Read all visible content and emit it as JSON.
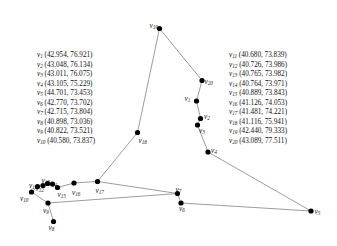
{
  "figure": {
    "type": "node-link-diagram",
    "background_color": "#ffffff",
    "node_color": "#000000",
    "edge_color": "#8a8a8a",
    "text_color": "#111111"
  },
  "coord_list_left": [
    {
      "id": "v",
      "sub": "1",
      "text": "(42.954, 76.921)"
    },
    {
      "id": "v",
      "sub": "2",
      "text": "(43.048, 76.134)"
    },
    {
      "id": "v",
      "sub": "3",
      "text": "(43.011, 76.075)"
    },
    {
      "id": "v",
      "sub": "4",
      "text": "(43.105, 75.229)"
    },
    {
      "id": "v",
      "sub": "5",
      "text": "(44.701, 73.453)"
    },
    {
      "id": "v",
      "sub": "6",
      "text": "(42.770, 73.702)"
    },
    {
      "id": "v",
      "sub": "7",
      "text": "(42.715, 73.804)"
    },
    {
      "id": "v",
      "sub": "8",
      "text": "(40.898, 73.036)"
    },
    {
      "id": "v",
      "sub": "9",
      "text": "(40.822, 73.521)"
    },
    {
      "id": "v",
      "sub": "10",
      "text": "(40.580, 73.837)"
    }
  ],
  "coord_list_right": [
    {
      "id": "v",
      "sub": "11",
      "text": "(40.680, 73.839)"
    },
    {
      "id": "v",
      "sub": "12",
      "text": "(40.726, 73.986)"
    },
    {
      "id": "v",
      "sub": "13",
      "text": "(40.765, 73.982)"
    },
    {
      "id": "v",
      "sub": "14",
      "text": "(40.764, 73.971)"
    },
    {
      "id": "v",
      "sub": "15",
      "text": "(40.889, 73.843)"
    },
    {
      "id": "v",
      "sub": "16",
      "text": "(41.126, 74.053)"
    },
    {
      "id": "v",
      "sub": "17",
      "text": "(41.481, 74.221)"
    },
    {
      "id": "v",
      "sub": "18",
      "text": "(41.116, 75.941)"
    },
    {
      "id": "v",
      "sub": "19",
      "text": "(42.440, 79.333)"
    },
    {
      "id": "v",
      "sub": "20",
      "text": "(43.089, 77.511)"
    }
  ],
  "nodes": [
    {
      "id": "v1",
      "sub": "1",
      "x": 196.5,
      "y": 101.0,
      "label_x": 184.5,
      "label_y": 95.0
    },
    {
      "id": "v2",
      "sub": "2",
      "x": 200.5,
      "y": 118.5,
      "label_x": 204.0,
      "label_y": 112.5
    },
    {
      "id": "v3",
      "sub": "3",
      "x": 197.5,
      "y": 125.0,
      "label_x": 199.0,
      "label_y": 127.0
    },
    {
      "id": "v4",
      "sub": "4",
      "x": 208.0,
      "y": 152.0,
      "label_x": 211.0,
      "label_y": 147.0
    },
    {
      "id": "v5",
      "sub": "5",
      "x": 311.0,
      "y": 211.0,
      "label_x": 314.5,
      "label_y": 207.5
    },
    {
      "id": "v6",
      "sub": "6",
      "x": 181.0,
      "y": 203.0,
      "label_x": 179.0,
      "label_y": 205.0
    },
    {
      "id": "v7",
      "sub": "7",
      "x": 177.5,
      "y": 193.5,
      "label_x": 175.5,
      "label_y": 186.0
    },
    {
      "id": "v8",
      "sub": "8",
      "x": 53.5,
      "y": 221.5,
      "label_x": 48.5,
      "label_y": 224.0
    },
    {
      "id": "v9",
      "sub": "9",
      "x": 48.0,
      "y": 203.0,
      "label_x": 43.0,
      "label_y": 206.5
    },
    {
      "id": "v10",
      "sub": "10",
      "x": 31.5,
      "y": 192.0,
      "label_x": 20.0,
      "label_y": 194.5
    },
    {
      "id": "v11",
      "sub": "11",
      "x": 37.5,
      "y": 186.5,
      "label_x": 29.0,
      "label_y": 182.0
    },
    {
      "id": "v12",
      "sub": "12",
      "x": 43.0,
      "y": 185.5,
      "label_x": 35.5,
      "label_y": 184.5
    },
    {
      "id": "v13",
      "sub": "13",
      "x": 47.5,
      "y": 183.5,
      "label_x": 41.5,
      "label_y": 176.5
    },
    {
      "id": "v14",
      "sub": "14",
      "x": 52.5,
      "y": 184.0,
      "label_x": 48.5,
      "label_y": 180.0
    },
    {
      "id": "v15",
      "sub": "15",
      "x": 57.5,
      "y": 187.5,
      "label_x": 57.5,
      "label_y": 190.5
    },
    {
      "id": "v16",
      "sub": "16",
      "x": 74.0,
      "y": 183.0,
      "label_x": 72.0,
      "label_y": 188.5
    },
    {
      "id": "v17",
      "sub": "17",
      "x": 97.5,
      "y": 181.5,
      "label_x": 95.5,
      "label_y": 186.5
    },
    {
      "id": "v18",
      "sub": "18",
      "x": 137.5,
      "y": 132.5,
      "label_x": 138.5,
      "label_y": 137.0
    },
    {
      "id": "v19",
      "sub": "19",
      "x": 159.5,
      "y": 28.5,
      "label_x": 149.5,
      "label_y": 22.0
    },
    {
      "id": "v20",
      "sub": "20",
      "x": 202.0,
      "y": 80.5,
      "label_x": 204.5,
      "label_y": 78.0
    }
  ],
  "edges": [
    [
      "v19",
      "v18"
    ],
    [
      "v19",
      "v20"
    ],
    [
      "v20",
      "v1"
    ],
    [
      "v1",
      "v2"
    ],
    [
      "v2",
      "v3"
    ],
    [
      "v3",
      "v4"
    ],
    [
      "v4",
      "v5"
    ],
    [
      "v5",
      "v6"
    ],
    [
      "v6",
      "v7"
    ],
    [
      "v7",
      "v9"
    ],
    [
      "v9",
      "v8"
    ],
    [
      "v9",
      "v10"
    ],
    [
      "v10",
      "v11"
    ],
    [
      "v11",
      "v12"
    ],
    [
      "v12",
      "v13"
    ],
    [
      "v13",
      "v14"
    ],
    [
      "v14",
      "v15"
    ],
    [
      "v15",
      "v16"
    ],
    [
      "v16",
      "v17"
    ],
    [
      "v17",
      "v18"
    ],
    [
      "v7",
      "v17"
    ]
  ]
}
